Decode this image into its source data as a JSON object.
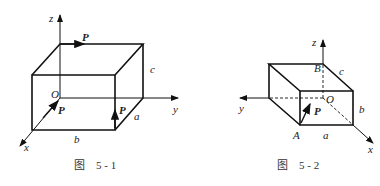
{
  "figure1": {
    "caption": "图    5 - 1",
    "axes": {
      "x": "x",
      "y": "y",
      "z": "z",
      "origin": "O"
    },
    "edges": {
      "a": "a",
      "b": "b",
      "c": "c"
    },
    "forces": [
      "P",
      "P",
      "P"
    ]
  },
  "figure2": {
    "caption": "图    5 - 2",
    "axes": {
      "x": "x",
      "y": "y",
      "z": "z",
      "origin": "O"
    },
    "points": {
      "A": "A",
      "B": "B"
    },
    "edges": {
      "a": "a",
      "b": "b",
      "c": "c"
    },
    "forces": [
      "P"
    ]
  }
}
